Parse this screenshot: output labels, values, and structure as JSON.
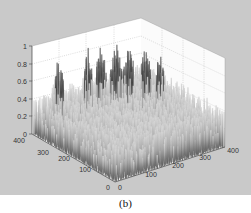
{
  "caption": "(b)",
  "chart_data": {
    "type": "surface3d",
    "title": "",
    "caption": "(b)",
    "xlabel": "",
    "ylabel": "",
    "zlabel": "",
    "x_ticks": [
      "0",
      "100",
      "200",
      "300",
      "400"
    ],
    "y_ticks": [
      "0",
      "100",
      "200",
      "300",
      "400"
    ],
    "z_ticks": [
      "0",
      "0.2",
      "0.4",
      "0.6",
      "0.8",
      "1"
    ],
    "xlim": [
      0,
      400
    ],
    "ylim": [
      0,
      400
    ],
    "zlim": [
      0,
      1
    ],
    "grid": true,
    "colormap": "gray",
    "peaks_approx": [
      {
        "x": 60,
        "y": 350,
        "z": 0.82
      },
      {
        "x": 150,
        "y": 330,
        "z": 0.85
      },
      {
        "x": 190,
        "y": 320,
        "z": 0.9
      },
      {
        "x": 230,
        "y": 300,
        "z": 0.95
      },
      {
        "x": 270,
        "y": 290,
        "z": 0.88
      },
      {
        "x": 300,
        "y": 250,
        "z": 0.85
      },
      {
        "x": 330,
        "y": 220,
        "z": 0.8
      }
    ]
  },
  "axes": {
    "z_labels": [
      "1",
      "0.8",
      "0.6",
      "0.4",
      "0.2",
      "0"
    ],
    "left_floor_labels": [
      "400",
      "300",
      "200",
      "100",
      "0"
    ],
    "right_floor_labels": [
      "0",
      "100",
      "200",
      "300",
      "400"
    ]
  }
}
